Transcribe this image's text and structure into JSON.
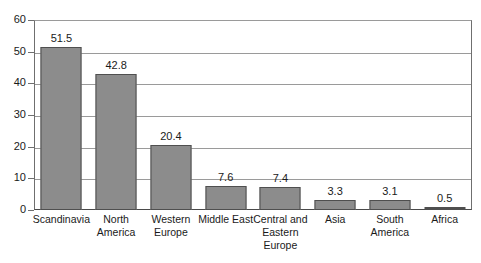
{
  "chart_data": {
    "type": "bar",
    "title": "",
    "subtitle": "",
    "xlabel": "",
    "ylabel": "",
    "ylim": [
      0,
      60
    ],
    "yticks": [
      0,
      10,
      20,
      30,
      40,
      50,
      60
    ],
    "grid": true,
    "legend": null,
    "orientation": "vertical",
    "bar_color": "#8c8c8c",
    "bar_edge_color": "#4f4f4f",
    "gridline_color": "#9a9a9a",
    "axis_color": "#4a4a4a",
    "categories": [
      "Scandinavia",
      "North America",
      "Western Europe",
      "Middle East",
      "Central and Eastern Europe",
      "Asia",
      "South America",
      "Africa"
    ],
    "category_lines": [
      [
        "Scandinavia"
      ],
      [
        "North",
        "America"
      ],
      [
        "Western",
        "Europe"
      ],
      [
        "Middle East"
      ],
      [
        "Central and",
        "Eastern",
        "Europe"
      ],
      [
        "Asia"
      ],
      [
        "South",
        "America"
      ],
      [
        "Africa"
      ]
    ],
    "values": [
      51.5,
      42.8,
      20.4,
      7.6,
      7.4,
      3.3,
      3.1,
      0.5
    ],
    "value_labels": [
      "51.5",
      "42.8",
      "20.4",
      "7.6",
      "7.4",
      "3.3",
      "3.1",
      "0.5"
    ]
  },
  "axis": {
    "y_tick_labels": [
      "0",
      "10",
      "20",
      "30",
      "40",
      "50",
      "60"
    ]
  }
}
